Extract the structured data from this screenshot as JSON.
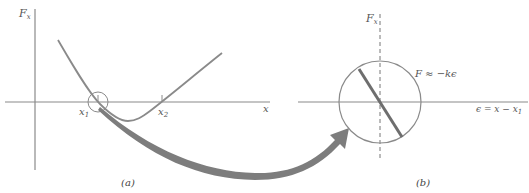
{
  "figure": {
    "panel_a": {
      "caption": "(a)",
      "y_axis_label": "F",
      "y_axis_sub": "x",
      "x_axis_label": "x",
      "root1_label": "x",
      "root1_sub": "1",
      "root2_label": "x",
      "root2_sub": "2"
    },
    "panel_b": {
      "caption": "(b)",
      "y_axis_label": "F",
      "y_axis_sub": "x",
      "force_law": "F ≈ −kϵ",
      "x_axis_label": "ϵ = x − x",
      "x_axis_sub": "1"
    },
    "colors": {
      "axis": "#8a8a8a",
      "curve": "#8a8a8a",
      "arrow": "#7d7d7d",
      "zoom_line": "#6e6e6e",
      "text": "#555555"
    }
  }
}
